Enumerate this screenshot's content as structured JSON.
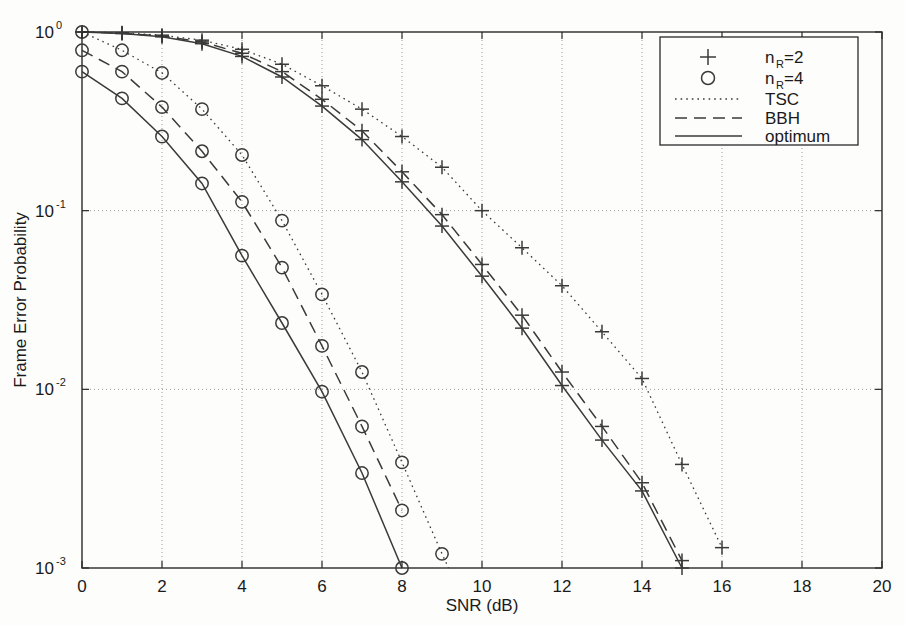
{
  "chart_data": {
    "type": "line",
    "title": "",
    "xlabel": "SNR (dB)",
    "ylabel": "Frame Error Probability",
    "xlim": [
      0,
      20
    ],
    "ylim": [
      0.001,
      1
    ],
    "yscale": "log",
    "grid": true,
    "xticks": [
      0,
      2,
      4,
      6,
      8,
      10,
      12,
      14,
      16,
      18,
      20
    ],
    "xtick_labels": [
      "0",
      "2",
      "4",
      "6",
      "8",
      "10",
      "12",
      "14",
      "16",
      "18",
      "20"
    ],
    "yticks": [
      1,
      0.1,
      0.01,
      0.001
    ],
    "ytick_labels": [
      "10^0",
      "10^-1",
      "10^-2",
      "10^-3"
    ],
    "ytick_base": [
      "10",
      "10",
      "10",
      "10"
    ],
    "ytick_exp": [
      "0",
      "-1",
      "-2",
      "-3"
    ],
    "legend_position": "upper right",
    "series": [
      {
        "name": "TSC, nR=2",
        "marker": "plus",
        "linestyle": "dotted",
        "color": "#3a3a3a",
        "x": [
          0,
          1,
          2,
          3,
          4,
          5,
          6,
          7,
          8,
          9,
          10,
          11,
          12,
          13,
          14,
          15,
          16
        ],
        "y": [
          1.0,
          0.99,
          0.96,
          0.9,
          0.8,
          0.66,
          0.5,
          0.37,
          0.26,
          0.175,
          0.1,
          0.062,
          0.038,
          0.021,
          0.0115,
          0.0038,
          0.0013
        ]
      },
      {
        "name": "BBH, nR=2",
        "marker": "plus",
        "linestyle": "dashed",
        "color": "#3a3a3a",
        "x": [
          0,
          1,
          2,
          3,
          4,
          5,
          6,
          7,
          8,
          9,
          10,
          11,
          12,
          13,
          14,
          15
        ],
        "y": [
          1.0,
          0.985,
          0.95,
          0.88,
          0.76,
          0.6,
          0.42,
          0.28,
          0.165,
          0.095,
          0.05,
          0.026,
          0.0125,
          0.0062,
          0.003,
          0.0011
        ]
      },
      {
        "name": "optimum, nR=2",
        "marker": "plus",
        "linestyle": "solid",
        "color": "#3a3a3a",
        "x": [
          0,
          1,
          2,
          3,
          4,
          5,
          6,
          7,
          8,
          9,
          10,
          11,
          12,
          13,
          14,
          15
        ],
        "y": [
          1.0,
          0.98,
          0.94,
          0.86,
          0.73,
          0.56,
          0.385,
          0.25,
          0.145,
          0.082,
          0.043,
          0.022,
          0.0105,
          0.0052,
          0.0027,
          0.001
        ]
      },
      {
        "name": "TSC, nR=4",
        "marker": "circle",
        "linestyle": "dotted",
        "color": "#3a3a3a",
        "x": [
          0,
          1,
          2,
          3,
          4,
          5,
          6,
          7,
          8,
          9,
          10
        ],
        "y": [
          1.0,
          0.79,
          0.59,
          0.37,
          0.205,
          0.088,
          0.034,
          0.0125,
          0.0039,
          0.0012,
          0.0004
        ]
      },
      {
        "name": "BBH, nR=4",
        "marker": "circle",
        "linestyle": "dashed",
        "color": "#3a3a3a",
        "x": [
          0,
          1,
          2,
          3,
          4,
          5,
          6,
          7,
          8
        ],
        "y": [
          0.79,
          0.6,
          0.38,
          0.215,
          0.112,
          0.048,
          0.0175,
          0.0062,
          0.0021
        ]
      },
      {
        "name": "optimum, nR=4",
        "marker": "circle",
        "linestyle": "solid",
        "color": "#3a3a3a",
        "x": [
          0,
          1,
          2,
          3,
          4,
          5,
          6,
          7,
          8
        ],
        "y": [
          0.6,
          0.425,
          0.26,
          0.142,
          0.056,
          0.0235,
          0.0097,
          0.0034,
          0.001
        ]
      }
    ]
  },
  "legend": {
    "items": [
      {
        "label_base": "n",
        "label_sub": "R",
        "label_tail": "=2",
        "sample": "plus"
      },
      {
        "label_base": "n",
        "label_sub": "R",
        "label_tail": "=4",
        "sample": "circle"
      },
      {
        "label_base": "TSC",
        "label_sub": "",
        "label_tail": "",
        "sample": "dotted"
      },
      {
        "label_base": "BBH",
        "label_sub": "",
        "label_tail": "",
        "sample": "dashed"
      },
      {
        "label_base": "optimum",
        "label_sub": "",
        "label_tail": "",
        "sample": "solid"
      }
    ]
  },
  "axes": {
    "x_title": "SNR (dB)",
    "y_title": "Frame Error Probability"
  },
  "colors": {
    "ink": "#3a3a3a",
    "grid": "#9a9a9a",
    "frame": "#2a2a2a",
    "background": "#fdfdfb"
  }
}
